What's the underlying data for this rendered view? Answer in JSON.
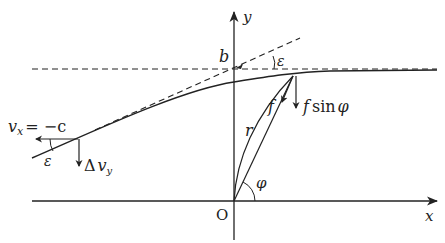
{
  "diagram": {
    "type": "physics-trajectory-deflection",
    "axes": {
      "x_label": "x",
      "y_label": "y",
      "origin_label": "O"
    },
    "labels": {
      "impact_parameter": "b",
      "epsilon_top": "ε",
      "epsilon_left": "ε",
      "velocity_x": "v",
      "velocity_x_sub": "x",
      "velocity_x_eq": "= −c",
      "delta": "Δ",
      "delta_v": "v",
      "delta_v_sub": "y",
      "force": "f",
      "force_component": "f",
      "sin_phi": "sin",
      "phi_symbol": "φ",
      "radius": "r",
      "angle_phi": "φ"
    },
    "colors": {
      "line": "#222222",
      "background": "#ffffff"
    }
  }
}
